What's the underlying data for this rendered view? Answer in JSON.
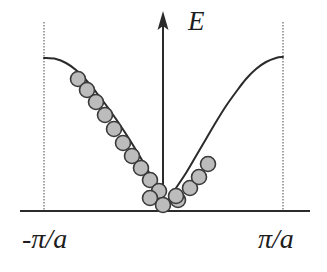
{
  "figure": {
    "name": "electron-energy-band-first-brillouin-zone",
    "background_color": "#ffffff"
  },
  "labels": {
    "energy_axis": "E",
    "left_zone_boundary": "-π/a",
    "right_zone_boundary": "π/a"
  },
  "colors": {
    "curve": "#2b2b2b",
    "axis": "#2b2b2b",
    "zone_boundary": "#8e8e8e",
    "dot_fill": "#bcbcbc",
    "dot_stroke": "#3a3a3a",
    "text": "#1d1d1d"
  },
  "chart_data": {
    "type": "line",
    "title": "",
    "xlabel": "",
    "ylabel": "E",
    "xlim": [
      -1,
      1
    ],
    "ylim": [
      0,
      1
    ],
    "grid": false,
    "legend": null,
    "x_tick_labels": [
      "-π/a",
      "π/a"
    ],
    "x_tick_positions": [
      -1,
      1
    ],
    "annotations": [
      "E",
      "-π/a",
      "π/a"
    ],
    "axes_pixels": {
      "x_axis_y": 211,
      "x_axis_x0": 20,
      "x_axis_x1": 310,
      "e_axis_x": 163,
      "e_axis_y_top": 14,
      "e_axis_y_bottom": 211,
      "left_boundary_x": 44,
      "right_boundary_x": 283,
      "boundary_y_top": 22,
      "boundary_y_bottom": 211
    },
    "series": [
      {
        "name": "energy-band",
        "description": "E(k) dispersion across the first Brillouin zone, cosine-like band minimum at k=0 flattening at the zone boundaries",
        "points": [
          [
            44,
            58
          ],
          [
            56,
            59
          ],
          [
            66,
            63
          ],
          [
            76,
            70
          ],
          [
            86,
            80
          ],
          [
            96,
            92
          ],
          [
            106,
            105
          ],
          [
            116,
            119
          ],
          [
            126,
            134
          ],
          [
            136,
            150
          ],
          [
            146,
            167
          ],
          [
            154,
            182
          ],
          [
            160,
            197
          ],
          [
            163,
            207
          ],
          [
            168,
            200
          ],
          [
            176,
            188
          ],
          [
            186,
            173
          ],
          [
            196,
            156
          ],
          [
            206,
            139
          ],
          [
            216,
            122
          ],
          [
            226,
            106
          ],
          [
            236,
            92
          ],
          [
            246,
            79
          ],
          [
            256,
            69
          ],
          [
            266,
            62
          ],
          [
            276,
            58
          ],
          [
            283,
            57
          ]
        ]
      }
    ],
    "occupied_states": {
      "name": "filled-electron-states",
      "radius_px": 7.5,
      "count": 17,
      "points": [
        [
          78,
          79
        ],
        [
          87,
          90
        ],
        [
          96,
          102
        ],
        [
          105,
          115
        ],
        [
          114,
          129
        ],
        [
          123,
          143
        ],
        [
          132,
          156
        ],
        [
          141,
          168
        ],
        [
          150,
          180
        ],
        [
          159,
          191
        ],
        [
          150,
          198
        ],
        [
          163,
          205
        ],
        [
          178,
          200
        ],
        [
          176,
          196
        ],
        [
          190,
          188
        ],
        [
          199,
          177
        ],
        [
          208,
          164
        ]
      ]
    }
  }
}
